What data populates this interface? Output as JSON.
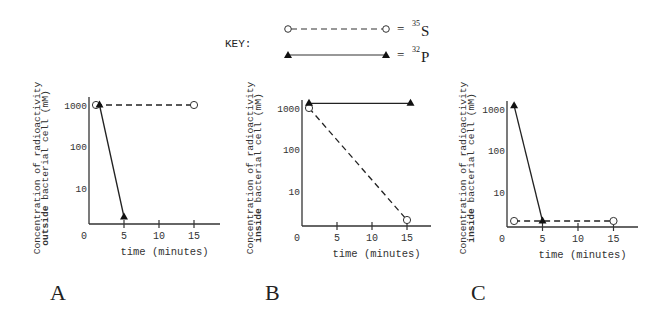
{
  "key": {
    "title": "KEY:",
    "entries": [
      {
        "label_eq": "=",
        "isotope_mass": "35",
        "isotope_symbol": "S",
        "line": "dashed",
        "marker": "open-circle"
      },
      {
        "label_eq": "=",
        "isotope_mass": "32",
        "isotope_symbol": "P",
        "line": "solid",
        "marker": "filled-triangle"
      }
    ]
  },
  "chart_data": [
    {
      "type": "line",
      "panel_label": "A",
      "title": "",
      "xlabel": "time (minutes)",
      "ylabel_line1": "Concentration of radioactivity",
      "ylabel_line2_bold": "outside",
      "ylabel_line2_rest": " bacterial cell (mM)",
      "yscale": "log",
      "yticks": [
        "1000",
        "100",
        "10"
      ],
      "xticks": [
        "0",
        "5",
        "10",
        "15"
      ],
      "xlim": [
        0,
        18
      ],
      "ylim": [
        1,
        1000
      ],
      "grid": false,
      "series": [
        {
          "name": "35S",
          "line": "dashed",
          "marker": "open-circle",
          "x": [
            1,
            15
          ],
          "y": [
            1000,
            1000
          ]
        },
        {
          "name": "32P",
          "line": "solid",
          "marker": "filled-triangle",
          "x": [
            1.5,
            5
          ],
          "y": [
            1000,
            2
          ]
        }
      ]
    },
    {
      "type": "line",
      "panel_label": "B",
      "title": "",
      "xlabel": "time (minutes)",
      "ylabel_line1": "Concentration of radioactivity",
      "ylabel_line2_bold": "inside",
      "ylabel_line2_rest": " bacterial cell (mM)",
      "yscale": "log",
      "yticks": [
        "1000",
        "100",
        "10"
      ],
      "xticks": [
        "0",
        "5",
        "10",
        "15"
      ],
      "xlim": [
        0,
        18
      ],
      "ylim": [
        1,
        1000
      ],
      "grid": false,
      "series": [
        {
          "name": "35S",
          "line": "dashed",
          "marker": "open-circle",
          "x": [
            1,
            15
          ],
          "y": [
            1000,
            2
          ]
        },
        {
          "name": "32P",
          "line": "solid",
          "marker": "filled-triangle",
          "x": [
            1,
            15.5
          ],
          "y": [
            1300,
            1300
          ]
        }
      ]
    },
    {
      "type": "line",
      "panel_label": "C",
      "title": "",
      "xlabel": "time (minutes)",
      "ylabel_line1": "Concentration of radioactivity",
      "ylabel_line2_bold": "inside",
      "ylabel_line2_rest": " bacterial cell (mM)",
      "yscale": "log",
      "yticks": [
        "1000",
        "100",
        "10"
      ],
      "xticks": [
        "0",
        "5",
        "10",
        "15"
      ],
      "xlim": [
        0,
        18
      ],
      "ylim": [
        1,
        1000
      ],
      "grid": false,
      "series": [
        {
          "name": "35S",
          "line": "dashed",
          "marker": "open-circle",
          "x": [
            1,
            15
          ],
          "y": [
            2,
            2
          ]
        },
        {
          "name": "32P",
          "line": "solid",
          "marker": "filled-triangle",
          "x": [
            1,
            5
          ],
          "y": [
            1200,
            2
          ]
        }
      ]
    }
  ]
}
